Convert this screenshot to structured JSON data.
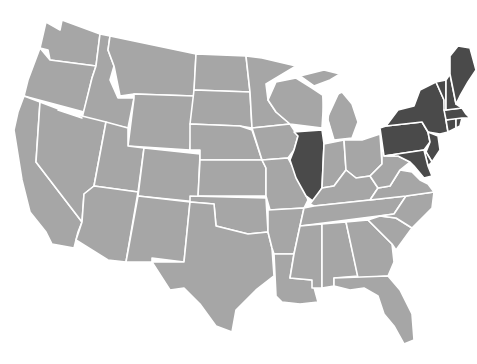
{
  "map": {
    "type": "choropleth",
    "region": "Contiguous United States",
    "colors": {
      "highlighted": "#4a4a4a",
      "default": "#a6a6a6",
      "border": "#ffffff",
      "background": "#ffffff"
    },
    "highlighted_states": [
      "ME",
      "NH",
      "VT",
      "MA",
      "RI",
      "CT",
      "NY",
      "NJ",
      "PA",
      "DE",
      "MD",
      "IL"
    ],
    "states": [
      {
        "id": "WA",
        "name": "Washington",
        "highlighted": false
      },
      {
        "id": "OR",
        "name": "Oregon",
        "highlighted": false
      },
      {
        "id": "CA",
        "name": "California",
        "highlighted": false
      },
      {
        "id": "ID",
        "name": "Idaho",
        "highlighted": false
      },
      {
        "id": "NV",
        "name": "Nevada",
        "highlighted": false
      },
      {
        "id": "MT",
        "name": "Montana",
        "highlighted": false
      },
      {
        "id": "WY",
        "name": "Wyoming",
        "highlighted": false
      },
      {
        "id": "UT",
        "name": "Utah",
        "highlighted": false
      },
      {
        "id": "AZ",
        "name": "Arizona",
        "highlighted": false
      },
      {
        "id": "CO",
        "name": "Colorado",
        "highlighted": false
      },
      {
        "id": "NM",
        "name": "New Mexico",
        "highlighted": false
      },
      {
        "id": "ND",
        "name": "North Dakota",
        "highlighted": false
      },
      {
        "id": "SD",
        "name": "South Dakota",
        "highlighted": false
      },
      {
        "id": "NE",
        "name": "Nebraska",
        "highlighted": false
      },
      {
        "id": "KS",
        "name": "Kansas",
        "highlighted": false
      },
      {
        "id": "OK",
        "name": "Oklahoma",
        "highlighted": false
      },
      {
        "id": "TX",
        "name": "Texas",
        "highlighted": false
      },
      {
        "id": "MN",
        "name": "Minnesota",
        "highlighted": false
      },
      {
        "id": "IA",
        "name": "Iowa",
        "highlighted": false
      },
      {
        "id": "MO",
        "name": "Missouri",
        "highlighted": false
      },
      {
        "id": "AR",
        "name": "Arkansas",
        "highlighted": false
      },
      {
        "id": "LA",
        "name": "Louisiana",
        "highlighted": false
      },
      {
        "id": "WI",
        "name": "Wisconsin",
        "highlighted": false
      },
      {
        "id": "IL",
        "name": "Illinois",
        "highlighted": true
      },
      {
        "id": "MI",
        "name": "Michigan",
        "highlighted": false
      },
      {
        "id": "IN",
        "name": "Indiana",
        "highlighted": false
      },
      {
        "id": "OH",
        "name": "Ohio",
        "highlighted": false
      },
      {
        "id": "KY",
        "name": "Kentucky",
        "highlighted": false
      },
      {
        "id": "TN",
        "name": "Tennessee",
        "highlighted": false
      },
      {
        "id": "MS",
        "name": "Mississippi",
        "highlighted": false
      },
      {
        "id": "AL",
        "name": "Alabama",
        "highlighted": false
      },
      {
        "id": "GA",
        "name": "Georgia",
        "highlighted": false
      },
      {
        "id": "FL",
        "name": "Florida",
        "highlighted": false
      },
      {
        "id": "SC",
        "name": "South Carolina",
        "highlighted": false
      },
      {
        "id": "NC",
        "name": "North Carolina",
        "highlighted": false
      },
      {
        "id": "VA",
        "name": "Virginia",
        "highlighted": false
      },
      {
        "id": "WV",
        "name": "West Virginia",
        "highlighted": false
      },
      {
        "id": "PA",
        "name": "Pennsylvania",
        "highlighted": true
      },
      {
        "id": "NY",
        "name": "New York",
        "highlighted": true
      },
      {
        "id": "NJ",
        "name": "New Jersey",
        "highlighted": true
      },
      {
        "id": "DE",
        "name": "Delaware",
        "highlighted": true
      },
      {
        "id": "MD",
        "name": "Maryland",
        "highlighted": true
      },
      {
        "id": "CT",
        "name": "Connecticut",
        "highlighted": true
      },
      {
        "id": "RI",
        "name": "Rhode Island",
        "highlighted": true
      },
      {
        "id": "MA",
        "name": "Massachusetts",
        "highlighted": true
      },
      {
        "id": "VT",
        "name": "Vermont",
        "highlighted": true
      },
      {
        "id": "NH",
        "name": "New Hampshire",
        "highlighted": true
      },
      {
        "id": "ME",
        "name": "Maine",
        "highlighted": true
      }
    ]
  }
}
